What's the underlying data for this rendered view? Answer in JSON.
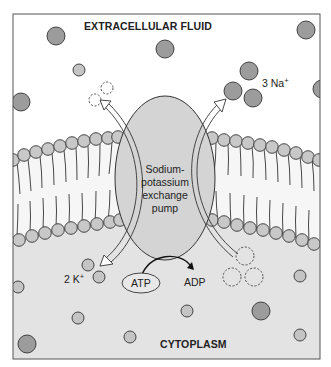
{
  "regions": {
    "extracellular_label": "EXTRACELLULAR FLUID",
    "cytoplasm_label": "CYTOPLASM"
  },
  "pump": {
    "label_lines": [
      "Sodium-",
      "potassium",
      "exchange",
      "pump"
    ]
  },
  "ions": {
    "sodium": {
      "count": "3",
      "symbol": "Na",
      "charge": "+"
    },
    "potassium": {
      "count": "2",
      "symbol": "K",
      "charge": "+"
    }
  },
  "energy": {
    "atp_label": "ATP",
    "adp_label": "ADP"
  },
  "colors": {
    "frame_border": "#555555",
    "extracellular_bg": "#ffffff",
    "cytoplasm_bg": "#e3e3e3",
    "membrane_core": "#f2f2f2",
    "phospholipid_head": "#c8c8c8",
    "pump_fill": "#d4d4d4",
    "sodium_ion": "#9c9c9c",
    "potassium_ion": "#c4c4c4",
    "outline": "#333333"
  }
}
